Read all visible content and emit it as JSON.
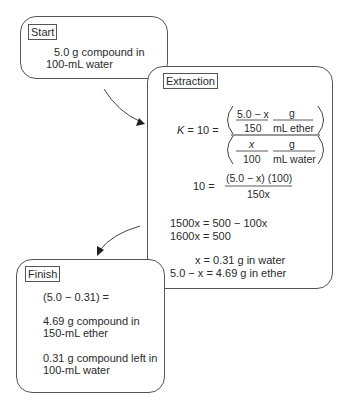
{
  "start": {
    "label": "Start",
    "line1": "5.0 g compound in",
    "line2": "100-mL water"
  },
  "extraction": {
    "label": "Extraction",
    "eq1": {
      "lhs": "K = 10 =",
      "top_frac1_num": "5.0 − x",
      "top_frac1_den": "150",
      "top_frac2_num": "g",
      "top_frac2_den": "mL ether",
      "bot_frac1_num": "x",
      "bot_frac1_den": "100",
      "bot_frac2_num": "g",
      "bot_frac2_den": "mL water"
    },
    "eq2": {
      "lhs": "10 =",
      "num": "(5.0 − x) (100)",
      "den": "150x"
    },
    "eq3": "1500x = 500 − 100x",
    "eq4": "1600x = 500",
    "eq5": "x = 0.31 g in water",
    "eq6": "5.0 − x = 4.69 g in ether"
  },
  "finish": {
    "label": "Finish",
    "line1": "(5.0 − 0.31) =",
    "line2": "4.69 g compound in",
    "line3": "150-mL ether",
    "line4": "0.31 g compound left in",
    "line5": "100-mL water"
  }
}
